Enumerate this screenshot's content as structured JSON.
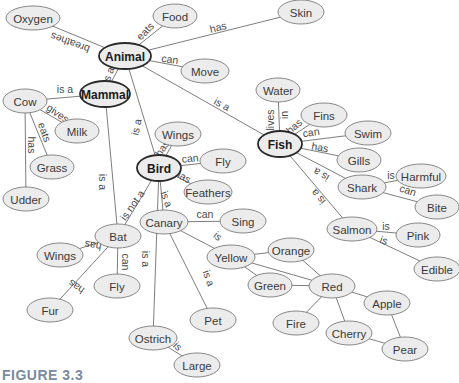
{
  "caption": "FIGURE 3.3",
  "colors": {
    "node_fill": "#ececec",
    "node_stroke": "#7a7a7a",
    "major_stroke": "#2a2a2a",
    "edge": "#6e6e6e",
    "caption": "#7a8aa0"
  },
  "nodes": [
    {
      "id": "oxygen",
      "label": "Oxygen",
      "x": 33,
      "y": 18,
      "rx": 27,
      "ry": 12
    },
    {
      "id": "food",
      "label": "Food",
      "x": 175,
      "y": 16,
      "rx": 22,
      "ry": 12
    },
    {
      "id": "skin",
      "label": "Skin",
      "x": 301,
      "y": 12,
      "rx": 23,
      "ry": 12
    },
    {
      "id": "animal",
      "label": "Animal",
      "x": 125,
      "y": 56,
      "rx": 26,
      "ry": 13,
      "major": true
    },
    {
      "id": "move",
      "label": "Move",
      "x": 205,
      "y": 71,
      "rx": 24,
      "ry": 12
    },
    {
      "id": "mammal",
      "label": "Mammal",
      "x": 105,
      "y": 94,
      "rx": 25,
      "ry": 13,
      "major": true
    },
    {
      "id": "cow",
      "label": "Cow",
      "x": 25,
      "y": 101,
      "rx": 22,
      "ry": 12
    },
    {
      "id": "milk",
      "label": "Milk",
      "x": 77,
      "y": 131,
      "rx": 22,
      "ry": 12
    },
    {
      "id": "grass",
      "label": "Grass",
      "x": 52,
      "y": 167,
      "rx": 22,
      "ry": 12
    },
    {
      "id": "udder",
      "label": "Udder",
      "x": 26,
      "y": 199,
      "rx": 23,
      "ry": 12
    },
    {
      "id": "water",
      "label": "Water",
      "x": 278,
      "y": 90,
      "rx": 22,
      "ry": 12
    },
    {
      "id": "fins",
      "label": "Fins",
      "x": 324,
      "y": 115,
      "rx": 23,
      "ry": 12
    },
    {
      "id": "fish",
      "label": "Fish",
      "x": 280,
      "y": 144,
      "rx": 22,
      "ry": 13,
      "major": true
    },
    {
      "id": "swim",
      "label": "Swim",
      "x": 368,
      "y": 133,
      "rx": 23,
      "ry": 12
    },
    {
      "id": "gills",
      "label": "Gills",
      "x": 359,
      "y": 160,
      "rx": 22,
      "ry": 12
    },
    {
      "id": "harmful",
      "label": "Harmful",
      "x": 421,
      "y": 176,
      "rx": 25,
      "ry": 12
    },
    {
      "id": "shark",
      "label": "Shark",
      "x": 362,
      "y": 187,
      "rx": 24,
      "ry": 12
    },
    {
      "id": "bite",
      "label": "Bite",
      "x": 437,
      "y": 207,
      "rx": 22,
      "ry": 12
    },
    {
      "id": "salmon",
      "label": "Salmon",
      "x": 352,
      "y": 229,
      "rx": 25,
      "ry": 12
    },
    {
      "id": "pink",
      "label": "Pink",
      "x": 418,
      "y": 235,
      "rx": 22,
      "ry": 12
    },
    {
      "id": "edible",
      "label": "Edible",
      "x": 437,
      "y": 269,
      "rx": 23,
      "ry": 12
    },
    {
      "id": "wings1",
      "label": "Wings",
      "x": 178,
      "y": 134,
      "rx": 23,
      "ry": 12
    },
    {
      "id": "bird",
      "label": "Bird",
      "x": 159,
      "y": 168,
      "rx": 22,
      "ry": 13,
      "major": true
    },
    {
      "id": "fly1",
      "label": "Fly",
      "x": 223,
      "y": 161,
      "rx": 23,
      "ry": 12
    },
    {
      "id": "feathers",
      "label": "Feathers",
      "x": 208,
      "y": 192,
      "rx": 24,
      "ry": 12
    },
    {
      "id": "canary",
      "label": "Canary",
      "x": 164,
      "y": 222,
      "rx": 24,
      "ry": 12
    },
    {
      "id": "sing",
      "label": "Sing",
      "x": 243,
      "y": 221,
      "rx": 23,
      "ry": 12
    },
    {
      "id": "yellow",
      "label": "Yellow",
      "x": 231,
      "y": 257,
      "rx": 24,
      "ry": 12
    },
    {
      "id": "orange",
      "label": "Orange",
      "x": 291,
      "y": 250,
      "rx": 23,
      "ry": 12
    },
    {
      "id": "green",
      "label": "Green",
      "x": 270,
      "y": 285,
      "rx": 22,
      "ry": 12
    },
    {
      "id": "red",
      "label": "Red",
      "x": 332,
      "y": 286,
      "rx": 23,
      "ry": 12
    },
    {
      "id": "apple",
      "label": "Apple",
      "x": 387,
      "y": 303,
      "rx": 23,
      "ry": 12
    },
    {
      "id": "fire",
      "label": "Fire",
      "x": 296,
      "y": 323,
      "rx": 23,
      "ry": 12
    },
    {
      "id": "cherry",
      "label": "Cherry",
      "x": 349,
      "y": 333,
      "rx": 23,
      "ry": 12
    },
    {
      "id": "pear",
      "label": "Pear",
      "x": 405,
      "y": 349,
      "rx": 23,
      "ry": 12
    },
    {
      "id": "pet",
      "label": "Pet",
      "x": 213,
      "y": 320,
      "rx": 23,
      "ry": 12
    },
    {
      "id": "ostrich",
      "label": "Ostrich",
      "x": 153,
      "y": 338,
      "rx": 24,
      "ry": 12
    },
    {
      "id": "large",
      "label": "Large",
      "x": 197,
      "y": 365,
      "rx": 23,
      "ry": 12
    },
    {
      "id": "bat",
      "label": "Bat",
      "x": 118,
      "y": 236,
      "rx": 23,
      "ry": 12
    },
    {
      "id": "wings2",
      "label": "Wings",
      "x": 60,
      "y": 255,
      "rx": 23,
      "ry": 12
    },
    {
      "id": "fly2",
      "label": "Fly",
      "x": 117,
      "y": 286,
      "rx": 23,
      "ry": 12
    },
    {
      "id": "fur",
      "label": "Fur",
      "x": 50,
      "y": 310,
      "rx": 23,
      "ry": 12
    }
  ],
  "edges": [
    {
      "from": "animal",
      "to": "oxygen",
      "label": "breathes",
      "lx": 70,
      "ly": 43,
      "rot": 200
    },
    {
      "from": "animal",
      "to": "food",
      "label": "eats",
      "lx": 145,
      "ly": 31,
      "rot": -45
    },
    {
      "from": "animal",
      "to": "skin",
      "label": "has",
      "lx": 218,
      "ly": 27,
      "rot": -14
    },
    {
      "from": "animal",
      "to": "move",
      "label": "can",
      "lx": 170,
      "ly": 59,
      "rot": 8
    },
    {
      "from": "animal",
      "to": "mammal",
      "label": "is a",
      "lx": 108,
      "ly": 75,
      "rot": -70
    },
    {
      "from": "animal",
      "to": "fish",
      "label": "is a",
      "lx": 222,
      "ly": 104,
      "rot": 28
    },
    {
      "from": "animal",
      "to": "bird",
      "label": "is a",
      "lx": 136,
      "ly": 127,
      "rot": -78
    },
    {
      "from": "mammal",
      "to": "cow",
      "label": "is a",
      "lx": 65,
      "ly": 89,
      "rot": 0
    },
    {
      "from": "mammal",
      "to": "bat",
      "label": "is a",
      "lx": 103,
      "ly": 182,
      "rot": 90
    },
    {
      "from": "cow",
      "to": "milk",
      "label": "gives",
      "lx": 58,
      "ly": 113,
      "rot": 35
    },
    {
      "from": "cow",
      "to": "grass",
      "label": "eats",
      "lx": 45,
      "ly": 132,
      "rot": 70
    },
    {
      "from": "cow",
      "to": "udder",
      "label": "has",
      "lx": 32,
      "ly": 145,
      "rot": 90
    },
    {
      "from": "fish",
      "to": "water",
      "label": "lives in",
      "lx": 277,
      "ly": 120,
      "rot": -90,
      "split": true
    },
    {
      "from": "fish",
      "to": "fins",
      "label": "has",
      "lx": 294,
      "ly": 126,
      "rot": -40
    },
    {
      "from": "fish",
      "to": "swim",
      "label": "can",
      "lx": 311,
      "ly": 132,
      "rot": -8
    },
    {
      "from": "fish",
      "to": "gills",
      "label": "has",
      "lx": 320,
      "ly": 147,
      "rot": 10
    },
    {
      "from": "fish",
      "to": "shark",
      "label": "is a",
      "lx": 321,
      "ly": 175,
      "rot": 210
    },
    {
      "from": "fish",
      "to": "salmon",
      "label": "is a",
      "lx": 318,
      "ly": 197,
      "rot": 230
    },
    {
      "from": "shark",
      "to": "harmful",
      "label": "is",
      "lx": 391,
      "ly": 175,
      "rot": 0
    },
    {
      "from": "shark",
      "to": "bite",
      "label": "can",
      "lx": 408,
      "ly": 190,
      "rot": 18
    },
    {
      "from": "salmon",
      "to": "pink",
      "label": "is",
      "lx": 386,
      "ly": 226,
      "rot": 0
    },
    {
      "from": "salmon",
      "to": "edible",
      "label": "is",
      "lx": 384,
      "ly": 240,
      "rot": 20
    },
    {
      "from": "bird",
      "to": "wings1",
      "label": "has",
      "lx": 162,
      "ly": 148,
      "rot": -55
    },
    {
      "from": "bird",
      "to": "fly1",
      "label": "can",
      "lx": 190,
      "ly": 158,
      "rot": -5
    },
    {
      "from": "bird",
      "to": "feathers",
      "label": "has",
      "lx": 183,
      "ly": 176,
      "rot": 30
    },
    {
      "from": "bird",
      "to": "canary",
      "label": "is a",
      "lx": 167,
      "ly": 199,
      "rot": 70
    },
    {
      "from": "bird",
      "to": "bat",
      "label": "is not a",
      "lx": 132,
      "ly": 205,
      "rot": -55
    },
    {
      "from": "bird",
      "to": "ostrich",
      "label": "is a",
      "lx": 146,
      "ly": 259,
      "rot": 90
    },
    {
      "from": "canary",
      "to": "sing",
      "label": "can",
      "lx": 205,
      "ly": 214,
      "rot": 0
    },
    {
      "from": "canary",
      "to": "yellow",
      "label": "is",
      "lx": 218,
      "ly": 236,
      "rot": 40
    },
    {
      "from": "canary",
      "to": "pet",
      "label": "is a",
      "lx": 209,
      "ly": 278,
      "rot": 70
    },
    {
      "from": "ostrich",
      "to": "large",
      "label": "is",
      "lx": 178,
      "ly": 346,
      "rot": 45
    },
    {
      "from": "bat",
      "to": "wings2",
      "label": "has",
      "lx": 93,
      "ly": 246,
      "rot": 190
    },
    {
      "from": "bat",
      "to": "fly2",
      "label": "can",
      "lx": 126,
      "ly": 262,
      "rot": 90
    },
    {
      "from": "bat",
      "to": "fur",
      "label": "has",
      "lx": 76,
      "ly": 287,
      "rot": 215
    },
    {
      "from": "yellow",
      "to": "orange",
      "label": "",
      "lx": 0,
      "ly": 0,
      "rot": 0
    },
    {
      "from": "yellow",
      "to": "green",
      "label": "",
      "lx": 0,
      "ly": 0,
      "rot": 0
    },
    {
      "from": "yellow",
      "to": "red",
      "label": "",
      "lx": 0,
      "ly": 0,
      "rot": 0
    },
    {
      "from": "orange",
      "to": "red",
      "label": "",
      "lx": 0,
      "ly": 0,
      "rot": 0
    },
    {
      "from": "green",
      "to": "red",
      "label": "",
      "lx": 0,
      "ly": 0,
      "rot": 0
    },
    {
      "from": "red",
      "to": "apple",
      "label": "",
      "lx": 0,
      "ly": 0,
      "rot": 0
    },
    {
      "from": "red",
      "to": "fire",
      "label": "",
      "lx": 0,
      "ly": 0,
      "rot": 0
    },
    {
      "from": "red",
      "to": "cherry",
      "label": "",
      "lx": 0,
      "ly": 0,
      "rot": 0
    },
    {
      "from": "apple",
      "to": "pear",
      "label": "",
      "lx": 0,
      "ly": 0,
      "rot": 0
    },
    {
      "from": "cherry",
      "to": "pear",
      "label": "",
      "lx": 0,
      "ly": 0,
      "rot": 0
    }
  ]
}
